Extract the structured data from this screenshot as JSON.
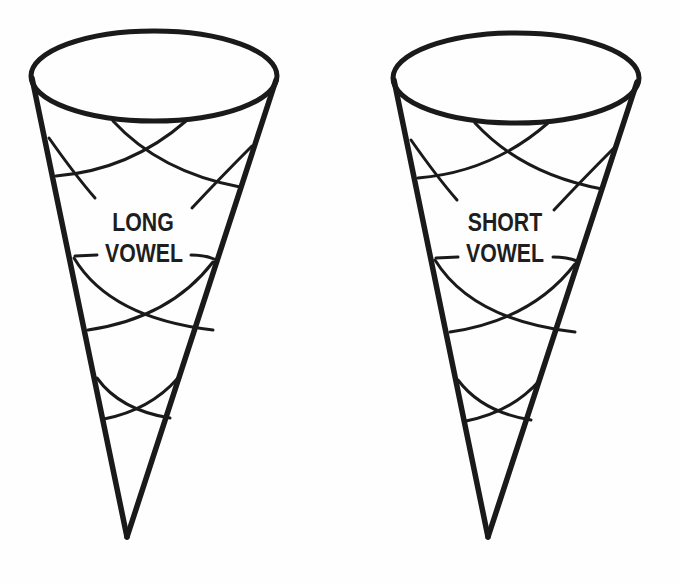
{
  "worksheet": {
    "cones": [
      {
        "id": "left",
        "label_line1": "LONG",
        "label_line2": "VOWEL"
      },
      {
        "id": "right",
        "label_line1": "SHORT",
        "label_line2": "VOWEL"
      }
    ],
    "colors": {
      "stroke": "#1a1a1a",
      "background": "#fefefe"
    }
  }
}
